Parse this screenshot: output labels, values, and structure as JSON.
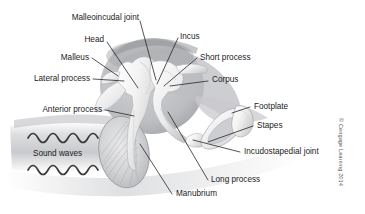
{
  "figure": {
    "credit": "© Cengage Learning 2014",
    "background_color": "#ffffff",
    "line_color": "#1c1c1c",
    "text_color": "#1c1c1c"
  },
  "labels": {
    "malleoincudal_joint": "Malleoincudal joint",
    "head": "Head",
    "malleus": "Malleus",
    "lateral_process": "Lateral process",
    "anterior_process": "Anterior process",
    "sound_waves": "Sound waves",
    "incus": "Incus",
    "short_process": "Short process",
    "corpus": "Corpus",
    "footplate": "Footplate",
    "stapes": "Stapes",
    "incudostapedial_joint": "Incudostapedial joint",
    "long_process": "Long process",
    "manubrium": "Manubrium"
  },
  "structures": {
    "tympanic_membrane": "tympanic-membrane",
    "malleus_bone": "malleus-bone",
    "incus_bone": "incus-bone",
    "stapes_bone": "stapes-bone",
    "sound_wave_upper": "sound-wave-upper",
    "sound_wave_lower": "sound-wave-lower",
    "ear_canal_shading": "ear-canal-shading"
  }
}
